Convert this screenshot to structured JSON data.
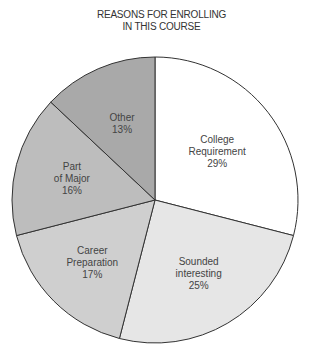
{
  "chart_data": {
    "type": "pie",
    "title": "REASONS FOR ENROLLING IN THIS COURSE",
    "title_lines": [
      "REASONS FOR ENROLLING",
      "IN THIS COURSE"
    ],
    "categories": [
      "College Requirement",
      "Sounded interesting",
      "Career Preparation",
      "Part of Major",
      "Other"
    ],
    "values": [
      29,
      25,
      17,
      16,
      13
    ],
    "unit": "%",
    "colors": [
      "#ffffff",
      "#e6e6e6",
      "#cfcfcf",
      "#bdbdbd",
      "#a9a9a9"
    ],
    "start_angle": "12 o'clock, clockwise",
    "legend": "none (labels inside slices)",
    "slices": [
      {
        "label_lines": [
          "College",
          "Requirement",
          "29%"
        ]
      },
      {
        "label_lines": [
          "Sounded",
          "interesting",
          "25%"
        ]
      },
      {
        "label_lines": [
          "Career",
          "Preparation",
          "17%"
        ]
      },
      {
        "label_lines": [
          "Part",
          "of Major",
          "16%"
        ]
      },
      {
        "label_lines": [
          "Other",
          "13%"
        ]
      }
    ]
  }
}
